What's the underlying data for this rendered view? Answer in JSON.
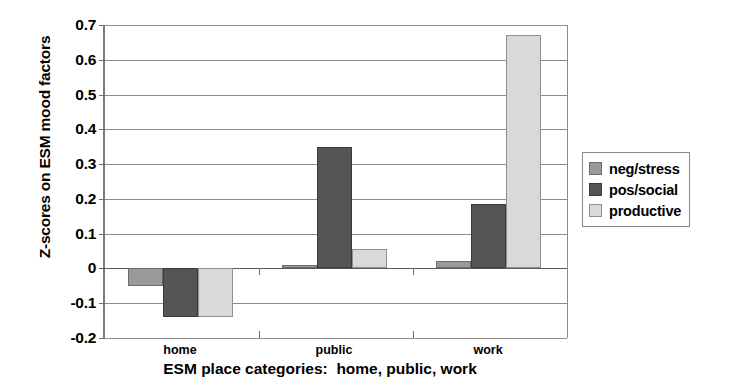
{
  "chart_data": {
    "type": "bar",
    "title": "",
    "xlabel": "ESM place categories:  home, public, work",
    "ylabel": "Z-scores on ESM mood factors",
    "categories": [
      "home",
      "public",
      "work"
    ],
    "ylim": [
      -0.2,
      0.7
    ],
    "ytick_labels": [
      "0.7",
      "0.6",
      "0.5",
      "0.4",
      "0.3",
      "0.2",
      "0.1",
      "0",
      "-0.1",
      "-0.2"
    ],
    "ytick_values": [
      0.7,
      0.6,
      0.5,
      0.4,
      0.3,
      0.2,
      0.1,
      0,
      -0.1,
      -0.2
    ],
    "grid": true,
    "legend_position": "right",
    "series": [
      {
        "name": "neg/stress",
        "color": "#999999",
        "values": [
          -0.05,
          0.01,
          0.02
        ]
      },
      {
        "name": "pos/social",
        "color": "#555555",
        "values": [
          -0.14,
          0.35,
          0.185
        ]
      },
      {
        "name": "productive",
        "color": "#d9d9d9",
        "values": [
          -0.14,
          0.055,
          0.67
        ]
      }
    ]
  },
  "legend": {
    "items": [
      {
        "label": "neg/stress",
        "swatch_name": "legend-swatch-neg-stress"
      },
      {
        "label": "pos/social",
        "swatch_name": "legend-swatch-pos-social"
      },
      {
        "label": "productive",
        "swatch_name": "legend-swatch-productive"
      }
    ]
  }
}
